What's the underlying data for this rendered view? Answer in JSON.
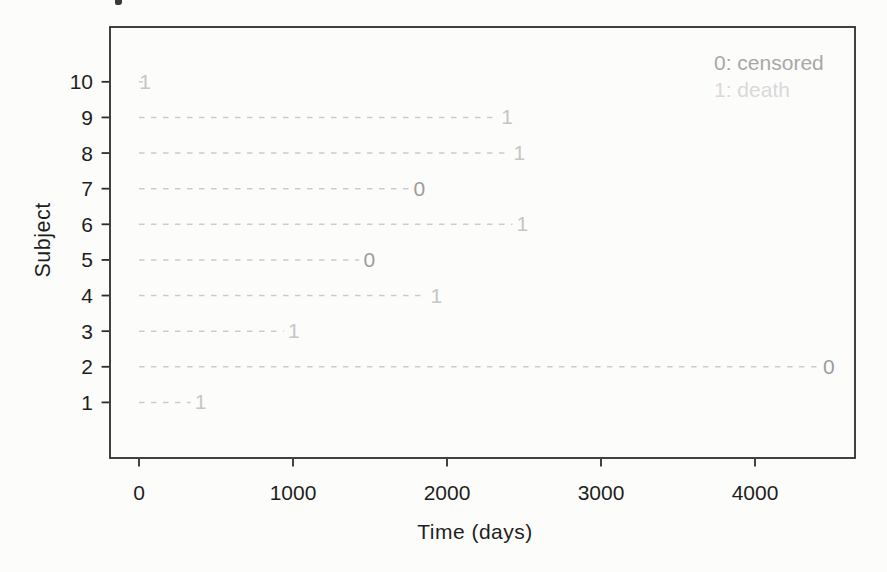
{
  "figure": {
    "y_axis_label": "Subject",
    "x_axis_label": "Time (days)",
    "legend": {
      "censored": {
        "label": "0: censored",
        "color": "#a8a8a8"
      },
      "death": {
        "label": "1: death",
        "color": "#d9d9d9"
      }
    }
  },
  "chart_data": {
    "type": "line",
    "variant": "subject-event-timeline (survival follow-up plot)",
    "title": "",
    "xlabel": "Time (days)",
    "ylabel": "Subject",
    "xlim": [
      0,
      4650
    ],
    "ylim": [
      0.5,
      10.9
    ],
    "x_ticks": [
      0,
      1000,
      2000,
      3000,
      4000
    ],
    "y_ticks": [
      1,
      2,
      3,
      4,
      5,
      6,
      7,
      8,
      9,
      10
    ],
    "grid": false,
    "legend": {
      "position": "top-right",
      "entries": [
        "0: censored",
        "1: death"
      ]
    },
    "marker_meaning": "Each subject has a horizontal dashed line from time 0 to the event time; the digit at the end gives status (0 = censored, 1 = death).",
    "subjects": [
      {
        "subject": 1,
        "time": 400,
        "status": 1
      },
      {
        "subject": 2,
        "time": 4480,
        "status": 0
      },
      {
        "subject": 3,
        "time": 1005,
        "status": 1
      },
      {
        "subject": 4,
        "time": 1930,
        "status": 1
      },
      {
        "subject": 5,
        "time": 1495,
        "status": 0
      },
      {
        "subject": 6,
        "time": 2490,
        "status": 1
      },
      {
        "subject": 7,
        "time": 1820,
        "status": 0
      },
      {
        "subject": 8,
        "time": 2470,
        "status": 1
      },
      {
        "subject": 9,
        "time": 2390,
        "status": 1
      },
      {
        "subject": 10,
        "time": 40,
        "status": 1
      }
    ],
    "colors": {
      "dashed_line": "#cccccc",
      "censored_marker": "#9d9d9d",
      "death_marker": "#c6c6c6",
      "axis": "#2d2d2d",
      "tick_text": "#1e1e1e",
      "background": "#fcfcfa"
    }
  }
}
